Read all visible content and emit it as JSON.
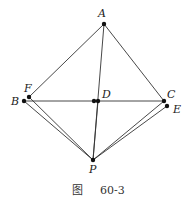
{
  "figure": {
    "caption_prefix": "图",
    "caption_number": "60-3",
    "points": [
      {
        "name": "A",
        "x": 104,
        "y": 24,
        "lx": 98,
        "ly": 17
      },
      {
        "name": "F",
        "x": 29,
        "y": 97,
        "lx": 24,
        "ly": 92
      },
      {
        "name": "B",
        "x": 24,
        "y": 101,
        "lx": 11,
        "ly": 105
      },
      {
        "name": "D",
        "x": 98,
        "y": 101,
        "lx": 102,
        "ly": 98
      },
      {
        "name": "C",
        "x": 164,
        "y": 101,
        "lx": 167,
        "ly": 98
      },
      {
        "name": "E",
        "x": 167,
        "y": 106,
        "lx": 173,
        "ly": 113
      },
      {
        "name": "P",
        "x": 93,
        "y": 160,
        "lx": 89,
        "ly": 173
      }
    ],
    "extra_dot": {
      "x": 94,
      "y": 101
    },
    "segments": [
      [
        "A",
        "F"
      ],
      [
        "A",
        "C"
      ],
      [
        "A",
        "P"
      ],
      [
        "B",
        "C"
      ],
      [
        "B",
        "P"
      ],
      [
        "F",
        "P"
      ],
      [
        "C",
        "P"
      ],
      [
        "E",
        "P"
      ],
      [
        "D",
        "P"
      ]
    ],
    "line_color": "#333333",
    "dot_color": "#111111"
  }
}
